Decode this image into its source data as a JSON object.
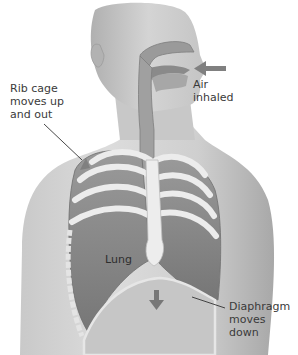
{
  "diagram": {
    "labels": {
      "rib_cage": "Rib cage\nmoves up\nand out",
      "air": "Air\ninhaled",
      "lung": "Lung",
      "diaphragm": "Diaphragm\nmoves down"
    },
    "arrows": [
      {
        "name": "air-inhaled-arrow",
        "direction": "left"
      },
      {
        "name": "rib-cage-arrow",
        "direction": "up-out"
      },
      {
        "name": "diaphragm-arrow",
        "direction": "down"
      }
    ],
    "colors": {
      "skin_light": "#d8d8d8",
      "skin_mid": "#bdbdbd",
      "skin_dark": "#9a9a9a",
      "lung": "#8a8a8a",
      "lung_dark": "#6f6f6f",
      "bone": "#ececec",
      "airway": "#9c9c9c",
      "arrow": "#808080",
      "leader": "#333333"
    }
  }
}
